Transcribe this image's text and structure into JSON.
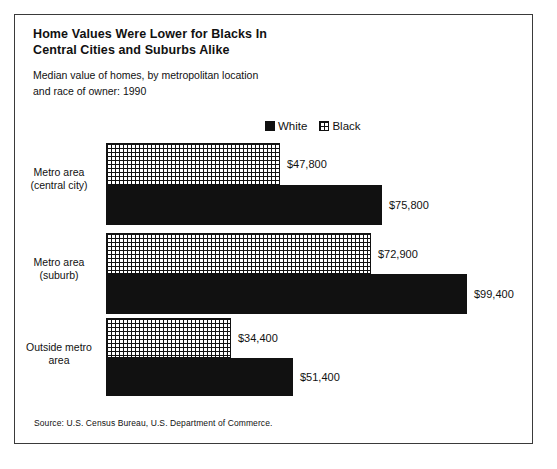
{
  "figure": {
    "title_line1": "Home Values Were Lower for Blacks In",
    "title_line2": "Central Cities and Suburbs Alike",
    "subtitle_line1": "Median value of homes, by metropolitan location",
    "subtitle_line2": "and race of owner:  1990",
    "source": "Source:  U.S. Census Bureau, U.S. Department of Commerce.",
    "border_color": "#3a3a3a"
  },
  "legend": {
    "position": "top-center",
    "entries": [
      {
        "label": "White",
        "swatch": "solid-black-square",
        "color": "#111111"
      },
      {
        "label": "Black",
        "swatch": "grid-hatched-square",
        "color": "#111111"
      }
    ]
  },
  "chart_data": {
    "type": "bar",
    "orientation": "horizontal",
    "title": "Home Values Were Lower for Blacks In Central Cities and Suburbs Alike",
    "subtitle": "Median value of homes, by metropolitan location and race of owner:  1990",
    "xlabel": "",
    "ylabel": "",
    "xlim": [
      0,
      99400
    ],
    "grid": false,
    "legend_position": "top-center",
    "categories": [
      "Metro area (central city)",
      "Metro area (suburb)",
      "Outside metro area"
    ],
    "category_lines": [
      [
        "Metro area",
        "(central city)"
      ],
      [
        "Metro area",
        "(suburb)"
      ],
      [
        "Outside metro",
        "area"
      ]
    ],
    "series": [
      {
        "name": "Black",
        "style": "grid-hatched",
        "values": [
          47800,
          72900,
          34400
        ],
        "labels": [
          "$47,800",
          "$72,900",
          "$34,400"
        ]
      },
      {
        "name": "White",
        "style": "solid-black",
        "values": [
          75800,
          99400,
          51400
        ],
        "labels": [
          "$75,800",
          "$99,400",
          "$51,400"
        ]
      }
    ]
  },
  "geometry": {
    "bar_origin_x": 91,
    "px_per_dollar": 0.003636,
    "groups": [
      {
        "black_top": 128,
        "white_top": 170,
        "bar_height": 42,
        "white_height": 40,
        "label_top": 151
      },
      {
        "black_top": 218,
        "white_top": 259,
        "bar_height": 41,
        "white_height": 40,
        "label_top": 241
      },
      {
        "black_top": 303,
        "white_top": 343,
        "bar_height": 40,
        "white_height": 38,
        "label_top": 326
      }
    ]
  }
}
